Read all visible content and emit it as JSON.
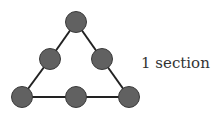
{
  "diagram": {
    "label": "1 section",
    "node_fill": "#616161",
    "node_stroke": "#3a3a3a",
    "edge_color": "#222222",
    "node_radius": 10.5,
    "nodes": [
      {
        "id": "top",
        "x": 76,
        "y": 22
      },
      {
        "id": "mid-left",
        "x": 50,
        "y": 59
      },
      {
        "id": "mid-right",
        "x": 102,
        "y": 59
      },
      {
        "id": "bottom-left",
        "x": 22,
        "y": 97
      },
      {
        "id": "bottom-mid",
        "x": 76,
        "y": 97
      },
      {
        "id": "bottom-right",
        "x": 129,
        "y": 97
      }
    ],
    "edges": [
      [
        "top",
        "mid-left"
      ],
      [
        "mid-left",
        "bottom-left"
      ],
      [
        "top",
        "mid-right"
      ],
      [
        "mid-right",
        "bottom-right"
      ],
      [
        "bottom-left",
        "bottom-mid"
      ],
      [
        "bottom-mid",
        "bottom-right"
      ]
    ]
  }
}
